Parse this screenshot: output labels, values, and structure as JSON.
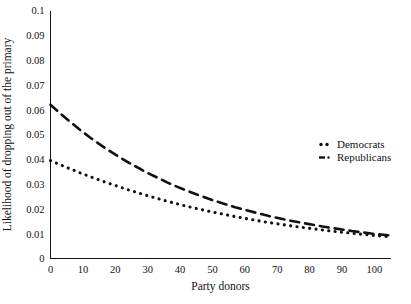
{
  "chart_data": {
    "type": "line",
    "title": "",
    "xlabel": "Party donors",
    "ylabel": "Likelihood of dropping out of the primary",
    "xlim": [
      0,
      105
    ],
    "ylim": [
      0,
      0.1
    ],
    "xticks": [
      0,
      10,
      20,
      30,
      40,
      50,
      60,
      70,
      80,
      90,
      100
    ],
    "xtick_labels": [
      "0",
      "10",
      "20",
      "30",
      "40",
      "50",
      "60",
      "70",
      "80",
      "90",
      "100"
    ],
    "yticks": [
      0,
      0.01,
      0.02,
      0.03,
      0.04,
      0.05,
      0.06,
      0.07,
      0.08,
      0.09,
      0.1
    ],
    "ytick_labels": [
      "0",
      "0.01",
      "0.02",
      "0.03",
      "0.04",
      "0.05",
      "0.06",
      "0.07",
      "0.08",
      "0.09",
      "0.1"
    ],
    "grid": false,
    "legend_position": "center-right",
    "series": [
      {
        "name": "Democrats",
        "style": "dotted",
        "color": "#111111",
        "x": [
          0,
          3,
          6,
          9,
          12,
          15,
          18,
          21,
          24,
          27,
          30,
          33,
          36,
          39,
          42,
          45,
          48,
          51,
          54,
          57,
          60,
          63,
          66,
          69,
          72,
          75,
          78,
          81,
          84,
          87,
          90,
          93,
          96,
          99,
          102,
          105
        ],
        "y": [
          0.0395,
          0.0378,
          0.0362,
          0.0346,
          0.0331,
          0.0317,
          0.0303,
          0.029,
          0.0277,
          0.0265,
          0.0253,
          0.0242,
          0.0231,
          0.0221,
          0.0211,
          0.0202,
          0.0193,
          0.0185,
          0.0177,
          0.0169,
          0.0162,
          0.0155,
          0.0148,
          0.0142,
          0.0136,
          0.013,
          0.0125,
          0.012,
          0.0115,
          0.011,
          0.0106,
          0.0102,
          0.0098,
          0.0094,
          0.0091,
          0.0088
        ]
      },
      {
        "name": "Republicans",
        "style": "dashed",
        "color": "#111111",
        "x": [
          0,
          3,
          6,
          9,
          12,
          15,
          18,
          21,
          24,
          27,
          30,
          33,
          36,
          39,
          42,
          45,
          48,
          51,
          54,
          57,
          60,
          63,
          66,
          69,
          72,
          75,
          78,
          81,
          84,
          87,
          90,
          93,
          96,
          99,
          102,
          105
        ],
        "y": [
          0.062,
          0.0585,
          0.0552,
          0.052,
          0.049,
          0.0462,
          0.0436,
          0.0411,
          0.0388,
          0.0366,
          0.0345,
          0.0326,
          0.0307,
          0.029,
          0.0274,
          0.0259,
          0.0245,
          0.0231,
          0.0219,
          0.0207,
          0.0196,
          0.0186,
          0.0176,
          0.0167,
          0.0158,
          0.015,
          0.0143,
          0.0136,
          0.0129,
          0.0123,
          0.0117,
          0.0111,
          0.0106,
          0.0101,
          0.0097,
          0.0093
        ]
      }
    ],
    "legend": [
      {
        "label": "Democrats",
        "marker": "dotted-line-marker"
      },
      {
        "label": "Republicans",
        "marker": "dash-dot-line-marker"
      }
    ]
  }
}
